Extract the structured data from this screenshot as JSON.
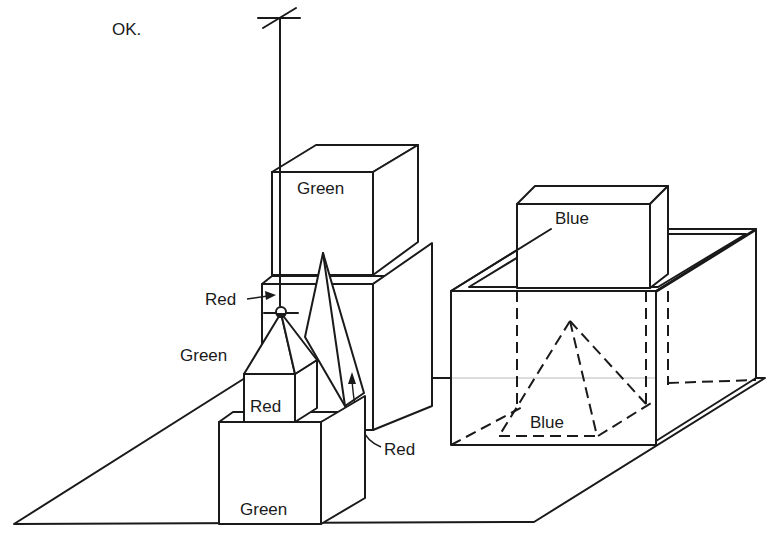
{
  "diagram": {
    "type": "blocks-world",
    "response_text": "OK.",
    "table": "table surface",
    "hand": "hand",
    "objects": [
      {
        "id": "green-block-large",
        "shape": "block",
        "label": "Green"
      },
      {
        "id": "red-block-back",
        "shape": "block",
        "label": ""
      },
      {
        "id": "red-pyramid-tall",
        "shape": "pyramid",
        "label": "Red"
      },
      {
        "id": "green-pyramid",
        "shape": "pyramid",
        "label": "Green"
      },
      {
        "id": "red-cube",
        "shape": "block",
        "label": "Red"
      },
      {
        "id": "green-block-front",
        "shape": "block",
        "label": "Green"
      },
      {
        "id": "red-ball-grasped",
        "shape": "ball",
        "label": "Red"
      },
      {
        "id": "blue-box",
        "shape": "box",
        "label": ""
      },
      {
        "id": "blue-block",
        "shape": "block",
        "label": "Blue"
      },
      {
        "id": "blue-pyramid",
        "shape": "pyramid",
        "label": "Blue"
      }
    ],
    "labels": {
      "ok": "OK.",
      "green_top": "Green",
      "red_ball": "Red",
      "green_pyramid": "Green",
      "red_cube": "Red",
      "green_front": "Green",
      "red_pyramid": "Red",
      "blue_block": "Blue",
      "blue_pyramid": "Blue"
    }
  }
}
